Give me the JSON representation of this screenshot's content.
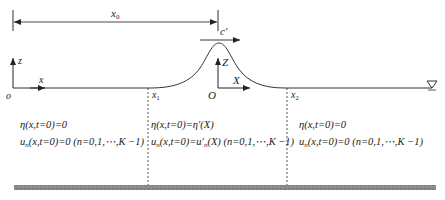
{
  "diagram": {
    "type": "solitary-wave-initial-condition-schematic",
    "dimension": {
      "label": "x",
      "label_sub": "0"
    },
    "wave_speed_label": "c′",
    "global_axes": {
      "origin": "o",
      "horizontal": "x",
      "vertical": "z"
    },
    "moving_axes": {
      "origin": "O",
      "horizontal": "X",
      "vertical": "Z"
    },
    "boundaries": [
      {
        "label": "x",
        "sub": "1"
      },
      {
        "label": "x",
        "sub": "2"
      }
    ],
    "water_level_symbol": "▽",
    "regions": [
      {
        "name": "left",
        "line1": "η(x,t=0)=0",
        "line2_u": "u",
        "line2_sub": "n",
        "line2_rest": "(x,t=0)=0 (n=0,1,⋯,K −1)"
      },
      {
        "name": "middle",
        "line1": "η(x,t=0)=η′(X)",
        "line2_u": "u",
        "line2_sub": "n",
        "line2_rest": "(x,t=0)=u′",
        "line2_sub2": "n",
        "line2_tail": "(X) (n=0,1,⋯,K −1)"
      },
      {
        "name": "right",
        "line1": "η(x,t=0)=0",
        "line2_u": "u",
        "line2_sub": "n",
        "line2_rest": "(x,t=0)=0 (n=0,1,⋯,K −1)"
      }
    ],
    "colors": {
      "line": "#333333",
      "bed": "#8a8a8a",
      "dash": "#555555"
    }
  }
}
